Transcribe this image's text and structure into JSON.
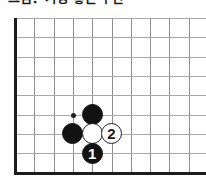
{
  "caption": {
    "text": "그림．가장 좋은 수단"
  },
  "board": {
    "colors": {
      "background": "#ffffff",
      "grid_line": "#8d8d8d",
      "grid_line_h": "#a8a8a8",
      "edge": "#1c1c1c",
      "black_stone": "#121212",
      "white_stone": "#ffffff",
      "white_stone_outline": "#1c1c1c"
    },
    "geometry": {
      "cell": 19.3,
      "origin_x": 15,
      "origin_y": 12,
      "cols": 10,
      "rows": 9,
      "stone_radius": 10.5,
      "edge_thickness": 3
    },
    "edges": {
      "left_label": "board-left-edge",
      "bottom_label": "board-bottom-edge"
    },
    "star_points": [
      {
        "col": 3,
        "row": 5,
        "name": "star-point-3-5"
      }
    ],
    "stones": [
      {
        "col": 4,
        "row": 5,
        "color": "black",
        "label": "",
        "name": "black-stone-upper"
      },
      {
        "col": 3,
        "row": 6,
        "color": "black",
        "label": "",
        "name": "black-stone-left"
      },
      {
        "col": 4,
        "row": 6,
        "color": "white",
        "label": "",
        "name": "white-stone-center"
      },
      {
        "col": 4,
        "row": 7,
        "color": "black",
        "label": "1",
        "name": "black-stone-move-1"
      },
      {
        "col": 5,
        "row": 6,
        "color": "white",
        "label": "2",
        "name": "white-stone-move-2"
      }
    ]
  }
}
